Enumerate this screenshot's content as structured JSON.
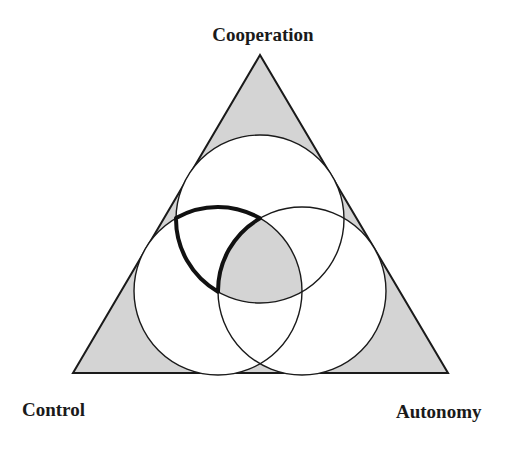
{
  "diagram": {
    "type": "triangle-venn",
    "labels": {
      "top": "Cooperation",
      "left": "Control",
      "right": "Autonomy"
    },
    "colors": {
      "fill_shaded": "#d4d4d4",
      "fill_circle": "#ffffff",
      "stroke": "#1a1a1a",
      "background": "#ffffff"
    },
    "elements": {
      "triangle": "outer triangle with shaded corners",
      "circles": [
        "top circle",
        "left circle",
        "right circle"
      ],
      "shaded_center": "intersection of all three circles",
      "highlighted_region": "overlap of top and left circles excluding right circle (bold outline)"
    }
  }
}
